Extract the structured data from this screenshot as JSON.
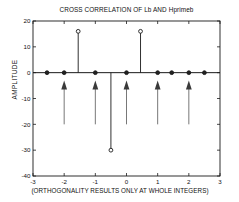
{
  "chart_data": {
    "type": "scatter",
    "title": "CROSS CORRELATION OF Lb AND Hprimeb",
    "xlabel": "(ORTHOGONALITY RESULTS ONLY AT WHOLE INTEGERS)",
    "ylabel": "AMPLITUDE",
    "xlim": [
      -3,
      3
    ],
    "ylim": [
      -40,
      20
    ],
    "xticks": [
      -3,
      -2,
      -1,
      0,
      1,
      2,
      3
    ],
    "xticklabels": [
      "-3",
      "-2",
      "-1",
      "0",
      "1",
      "2",
      "3"
    ],
    "yticks": [
      -40,
      -30,
      -20,
      -10,
      0,
      10,
      20
    ],
    "yticklabels": [
      "-40",
      "-30",
      "-20",
      "-10",
      "0",
      "10",
      "20"
    ],
    "grid": false,
    "legend": null,
    "marker": "circle-open",
    "stems": [
      {
        "x": -2.55,
        "y": 0
      },
      {
        "x": -2.0,
        "y": 0
      },
      {
        "x": -1.55,
        "y": 16
      },
      {
        "x": -1.0,
        "y": 0
      },
      {
        "x": -0.5,
        "y": -30
      },
      {
        "x": 0.0,
        "y": 0
      },
      {
        "x": 0.45,
        "y": 16
      },
      {
        "x": 1.0,
        "y": 0
      },
      {
        "x": 1.45,
        "y": 0
      },
      {
        "x": 2.0,
        "y": 0
      },
      {
        "x": 2.5,
        "y": 0
      }
    ],
    "annotations": {
      "type": "arrow-up",
      "description": "Upward arrows marking whole-integer lags where orthogonality holds",
      "x_positions": [
        -2,
        -1,
        0,
        1,
        2
      ],
      "tail_y": -20,
      "head_y": -3
    }
  },
  "axes": {
    "frame_color": "#1a1a1a"
  }
}
